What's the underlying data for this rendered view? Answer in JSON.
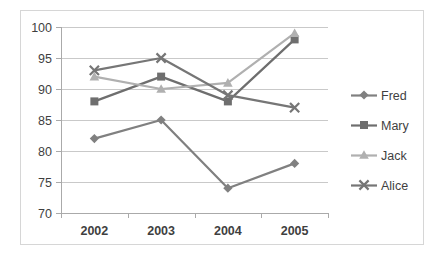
{
  "chart_data": {
    "type": "line",
    "title": "",
    "subtitle": "",
    "xlabel": "",
    "ylabel": "",
    "categories": [
      "2002",
      "2003",
      "2004",
      "2005"
    ],
    "ylim": [
      70,
      100
    ],
    "ytick_step": 5,
    "yticks": [
      "70",
      "75",
      "80",
      "85",
      "90",
      "95",
      "100"
    ],
    "grid": true,
    "legend_position": "right",
    "series": [
      {
        "name": "Fred",
        "values": [
          82,
          85,
          74,
          78
        ],
        "color": "#808080",
        "marker": "diamond"
      },
      {
        "name": "Mary",
        "values": [
          88,
          92,
          88,
          98
        ],
        "color": "#6e6e6e",
        "marker": "square"
      },
      {
        "name": "Jack",
        "values": [
          92,
          90,
          91,
          99
        ],
        "color": "#b0b0b0",
        "marker": "triangle"
      },
      {
        "name": "Alice",
        "values": [
          93,
          95,
          89,
          87
        ],
        "color": "#767676",
        "marker": "cross"
      }
    ]
  },
  "legend": {
    "entries": [
      "Fred",
      "Mary",
      "Jack",
      "Alice"
    ]
  },
  "axes": {
    "y_labels": [
      "100",
      "95",
      "90",
      "85",
      "80",
      "75",
      "70"
    ],
    "x_labels": [
      "2002",
      "2003",
      "2004",
      "2005"
    ]
  },
  "colors": {
    "gridline": "#c9c9c9",
    "axis": "#aaaaaa",
    "text": "#3f3f3f",
    "frame": "#d6d6d6",
    "background": "#ffffff"
  }
}
